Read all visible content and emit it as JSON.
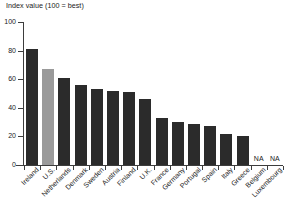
{
  "chart_data": {
    "type": "bar",
    "title": "Index value (100 = best)",
    "xlabel": "",
    "ylabel": "Index value (100 = best)",
    "ylim": [
      0,
      100
    ],
    "yticks": [
      0,
      20,
      40,
      60,
      80,
      100
    ],
    "grid": false,
    "legend": "none",
    "categories": [
      "Ireland",
      "U.S.",
      "Netherlands",
      "Denmark",
      "Sweden",
      "Austria",
      "Finland",
      "U.K.",
      "France",
      "Germany",
      "Portugal",
      "Spain",
      "Italy",
      "Greece",
      "Belgium",
      "Luxembourg"
    ],
    "values": [
      81,
      67,
      61,
      56,
      53,
      52,
      51,
      46,
      33,
      30,
      29,
      27,
      22,
      20,
      null,
      null
    ],
    "value_labels": [
      "",
      "",
      "",
      "",
      "",
      "",
      "",
      "",
      "",
      "",
      "",
      "",
      "",
      "",
      "NA",
      "NA"
    ],
    "highlight_category": "U.S.",
    "colors": {
      "bar": "#2b2b2b",
      "bar_highlight": "#9a9a9a",
      "axis": "#3d3d3d",
      "text": "#1a1a1a",
      "background": "#ffffff"
    }
  }
}
